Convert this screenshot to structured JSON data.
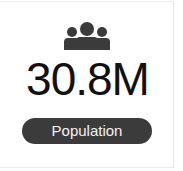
{
  "card": {
    "icon": "people-group-icon",
    "value": "30.8M",
    "label": "Population"
  },
  "colors": {
    "icon": "#3b3b3b",
    "value": "#111111",
    "pill_bg": "#3b3b3b",
    "pill_text": "#f2f2f2"
  }
}
